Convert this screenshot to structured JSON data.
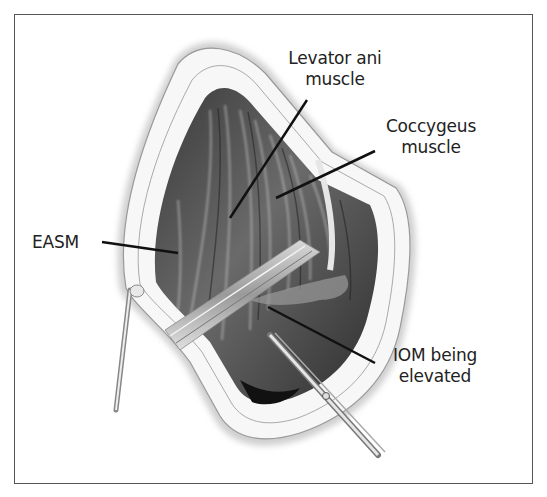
{
  "figure": {
    "type": "surgical-illustration",
    "frame_color": "#555555",
    "labels": {
      "levator": "Levator ani muscle",
      "levator_line1": "Levator ani",
      "levator_line2": "muscle",
      "coccygeus_line1": "Coccygeus",
      "coccygeus_line2": "muscle",
      "easm": "EASM",
      "iom_line1": "IOM being",
      "iom_line2": "elevated"
    },
    "instruments": [
      "retractor",
      "scissors"
    ]
  }
}
